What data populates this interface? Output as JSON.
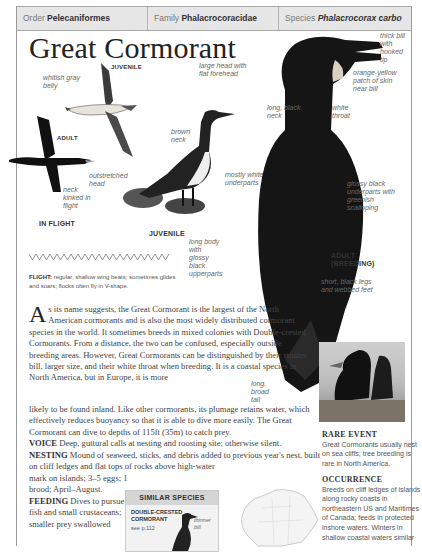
{
  "header": {
    "order_label": "Order",
    "order_value": "Pelecaniformes",
    "family_label": "Family",
    "family_value": "Phalacrocoracidae",
    "species_label": "Species",
    "species_value": "Phalacrocorax carbo"
  },
  "title": "Great Cormorant",
  "illustration": {
    "tags": {
      "juvenile_flight": "JUVENILE",
      "adult_flight": "ADULT",
      "in_flight": "IN FLIGHT",
      "juvenile": "JUVENILE",
      "adult_breeding_1": "ADULT",
      "adult_breeding_2": "(BREEDING)"
    },
    "labels": {
      "whitish_gray_belly": "whitish gray belly",
      "outstretched_head": "outstretched head",
      "neck_kinked": "neck kinked in flight",
      "brown_neck": "brown neck",
      "mostly_white_underparts": "mostly white underparts",
      "large_head": "large head with flat forehead",
      "long_black_neck": "long, black neck",
      "thick_bill": "thick bill with hooked tip",
      "orange_yellow_patch": "orange-yellow patch of skin near bill",
      "white_throat": "white throat",
      "glossy_black_underparts": "glossy black underparts with greenish scalloping",
      "long_body": "long body with glossy black upperparts",
      "short_black_legs": "short, black legs and webbed feet",
      "long_broad_tail": "long, broad tail"
    }
  },
  "flight": {
    "label": "FLIGHT:",
    "text": "regular, shallow wing beats; sometimes glides and soars; flocks often fly in V-shape."
  },
  "description": {
    "dropcap": "A",
    "text_wrapped": "s its name suggests, the Great Cormorant is the largest of the North American cormorants and is also the most widely distributed cormorant species in the world. It sometimes breeds in mixed colonies with Double-crested Cormorants. From a distance, the two can be confused, especially outside breeding areas. However, Great Cormorants can be distinguished by their stouter bill, larger size, and their white throat when breeding. It is a coastal species in North America, but in Europe, it is more",
    "text_full": "likely to be found inland. Like other cormorants, its plumage retains water, which effectively reduces buoyancy so that it is able to dive more easily. The Great Cormorant can dive to depths of 115ft (35m) to catch prey."
  },
  "voice": {
    "label": "VOICE",
    "text": "Deep, guttural calls at nesting and roosting site; otherwise silent."
  },
  "nesting": {
    "label": "NESTING",
    "text_full": "Mound of seaweed, sticks, and debris added to previous year's nest, built on cliff ledges and flat tops of rocks above high-water",
    "text_narrow": "mark on islands; 3–5 eggs; 1 brood; April–August."
  },
  "feeding": {
    "label": "FEEDING",
    "text": "Dives to pursue fish and small crustaceans; smaller prey swallowed"
  },
  "similar_species": {
    "heading": "SIMILAR SPECIES",
    "name_line1": "DOUBLE-CRESTED",
    "name_line2": "CORMORANT",
    "ref": "see p.112",
    "note": "thinner bill"
  },
  "rare_event": {
    "heading": "RARE EVENT",
    "text": "Great Cormorants usually nest on sea cliffs; tree breeding is rare in North America."
  },
  "occurrence": {
    "heading": "OCCURRENCE",
    "text": "Breeds on cliff ledges of islands along rocky coasts in northeastern US and Maritimes of Canada; feeds in protected inshore waters. Winters in shallow coastal waters similar"
  },
  "colors": {
    "header_bg": "#e6e6e6",
    "border": "#9a9a9a",
    "text": "#444444",
    "label_text": "#666666"
  }
}
